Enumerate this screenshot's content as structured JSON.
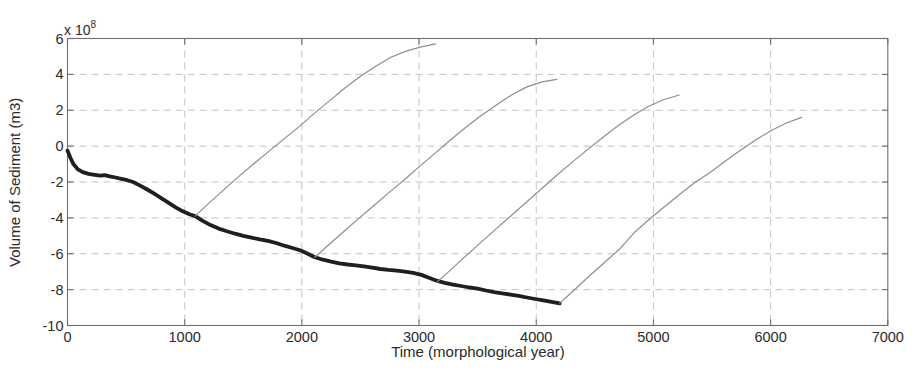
{
  "figure": {
    "background_color": "#ffffff",
    "text_color": "#2b2b2b"
  },
  "chart_data": {
    "type": "line",
    "title": "",
    "xlabel": "Time (morphological year)",
    "ylabel": "Volume of Sediment (m3)",
    "exponent_mantissa": "x 10",
    "exponent_power": "8",
    "xlim": [
      0,
      7000
    ],
    "ylim_1e8": [
      -10,
      6
    ],
    "x_ticks": [
      0,
      1000,
      2000,
      3000,
      4000,
      5000,
      6000,
      7000
    ],
    "y_ticks_1e8": [
      6,
      4,
      2,
      0,
      -2,
      -4,
      -6,
      -8,
      -10
    ],
    "grid": "dashed",
    "grid_color": "#c3c3c3",
    "axis_color": "#6e6e6e",
    "legend": "none",
    "units_note": "y values in units of 1e8 m3",
    "series": [
      {
        "name": "thick-black-baseline",
        "color": "#1f1f1f",
        "width": 3.8,
        "points": [
          [
            0,
            -0.25
          ],
          [
            25,
            -0.65
          ],
          [
            50,
            -1.0
          ],
          [
            90,
            -1.3
          ],
          [
            130,
            -1.45
          ],
          [
            180,
            -1.55
          ],
          [
            230,
            -1.6
          ],
          [
            280,
            -1.65
          ],
          [
            320,
            -1.62
          ],
          [
            360,
            -1.68
          ],
          [
            410,
            -1.75
          ],
          [
            460,
            -1.82
          ],
          [
            510,
            -1.9
          ],
          [
            560,
            -2.0
          ],
          [
            620,
            -2.2
          ],
          [
            680,
            -2.42
          ],
          [
            740,
            -2.65
          ],
          [
            800,
            -2.9
          ],
          [
            860,
            -3.15
          ],
          [
            920,
            -3.4
          ],
          [
            980,
            -3.62
          ],
          [
            1040,
            -3.8
          ],
          [
            1090,
            -3.9
          ],
          [
            1150,
            -4.15
          ],
          [
            1220,
            -4.4
          ],
          [
            1290,
            -4.6
          ],
          [
            1360,
            -4.75
          ],
          [
            1430,
            -4.88
          ],
          [
            1500,
            -5.0
          ],
          [
            1570,
            -5.1
          ],
          [
            1640,
            -5.2
          ],
          [
            1710,
            -5.28
          ],
          [
            1780,
            -5.4
          ],
          [
            1850,
            -5.55
          ],
          [
            1920,
            -5.68
          ],
          [
            1990,
            -5.82
          ],
          [
            2050,
            -6.0
          ],
          [
            2110,
            -6.2
          ],
          [
            2180,
            -6.33
          ],
          [
            2250,
            -6.44
          ],
          [
            2320,
            -6.53
          ],
          [
            2390,
            -6.6
          ],
          [
            2460,
            -6.65
          ],
          [
            2530,
            -6.7
          ],
          [
            2600,
            -6.78
          ],
          [
            2670,
            -6.85
          ],
          [
            2740,
            -6.9
          ],
          [
            2810,
            -6.94
          ],
          [
            2880,
            -7.0
          ],
          [
            2950,
            -7.06
          ],
          [
            3020,
            -7.18
          ],
          [
            3090,
            -7.35
          ],
          [
            3150,
            -7.5
          ],
          [
            3220,
            -7.62
          ],
          [
            3290,
            -7.72
          ],
          [
            3360,
            -7.8
          ],
          [
            3430,
            -7.88
          ],
          [
            3500,
            -7.95
          ],
          [
            3570,
            -8.05
          ],
          [
            3640,
            -8.14
          ],
          [
            3710,
            -8.21
          ],
          [
            3780,
            -8.28
          ],
          [
            3850,
            -8.35
          ],
          [
            3920,
            -8.44
          ],
          [
            3990,
            -8.52
          ],
          [
            4060,
            -8.6
          ],
          [
            4130,
            -8.68
          ],
          [
            4200,
            -8.77
          ]
        ]
      },
      {
        "name": "thin-gray-scenario-1",
        "color": "#8d8d8d",
        "width": 1.2,
        "points": [
          [
            1090,
            -3.9
          ],
          [
            1200,
            -3.22
          ],
          [
            1330,
            -2.45
          ],
          [
            1460,
            -1.7
          ],
          [
            1590,
            -0.98
          ],
          [
            1720,
            -0.28
          ],
          [
            1850,
            0.42
          ],
          [
            1980,
            1.1
          ],
          [
            2110,
            1.85
          ],
          [
            2240,
            2.55
          ],
          [
            2370,
            3.25
          ],
          [
            2500,
            3.9
          ],
          [
            2630,
            4.45
          ],
          [
            2760,
            4.95
          ],
          [
            2890,
            5.3
          ],
          [
            3010,
            5.52
          ],
          [
            3140,
            5.7
          ]
        ]
      },
      {
        "name": "thin-gray-scenario-2",
        "color": "#8d8d8d",
        "width": 1.2,
        "points": [
          [
            2110,
            -6.2
          ],
          [
            2230,
            -5.5
          ],
          [
            2360,
            -4.75
          ],
          [
            2490,
            -4.0
          ],
          [
            2620,
            -3.28
          ],
          [
            2750,
            -2.55
          ],
          [
            2880,
            -1.85
          ],
          [
            3010,
            -1.1
          ],
          [
            3140,
            -0.38
          ],
          [
            3270,
            0.35
          ],
          [
            3400,
            1.05
          ],
          [
            3530,
            1.7
          ],
          [
            3660,
            2.3
          ],
          [
            3790,
            2.85
          ],
          [
            3920,
            3.3
          ],
          [
            4050,
            3.58
          ],
          [
            4175,
            3.72
          ]
        ]
      },
      {
        "name": "thin-gray-scenario-3",
        "color": "#8d8d8d",
        "width": 1.2,
        "points": [
          [
            3150,
            -7.6
          ],
          [
            3270,
            -6.9
          ],
          [
            3400,
            -6.12
          ],
          [
            3530,
            -5.35
          ],
          [
            3660,
            -4.6
          ],
          [
            3790,
            -3.85
          ],
          [
            3920,
            -3.1
          ],
          [
            4050,
            -2.35
          ],
          [
            4180,
            -1.6
          ],
          [
            4310,
            -0.88
          ],
          [
            4440,
            -0.18
          ],
          [
            4570,
            0.5
          ],
          [
            4700,
            1.15
          ],
          [
            4830,
            1.72
          ],
          [
            4960,
            2.22
          ],
          [
            5090,
            2.6
          ],
          [
            5220,
            2.85
          ]
        ]
      },
      {
        "name": "thin-gray-scenario-4",
        "color": "#8d8d8d",
        "width": 1.2,
        "points": [
          [
            4200,
            -8.75
          ],
          [
            4320,
            -8.05
          ],
          [
            4450,
            -7.25
          ],
          [
            4580,
            -6.5
          ],
          [
            4710,
            -5.75
          ],
          [
            4840,
            -4.8
          ],
          [
            4970,
            -4.05
          ],
          [
            5100,
            -3.35
          ],
          [
            5230,
            -2.65
          ],
          [
            5360,
            -2.0
          ],
          [
            5490,
            -1.45
          ],
          [
            5620,
            -0.8
          ],
          [
            5750,
            -0.2
          ],
          [
            5880,
            0.38
          ],
          [
            6010,
            0.88
          ],
          [
            6140,
            1.3
          ],
          [
            6265,
            1.6
          ]
        ]
      }
    ]
  }
}
